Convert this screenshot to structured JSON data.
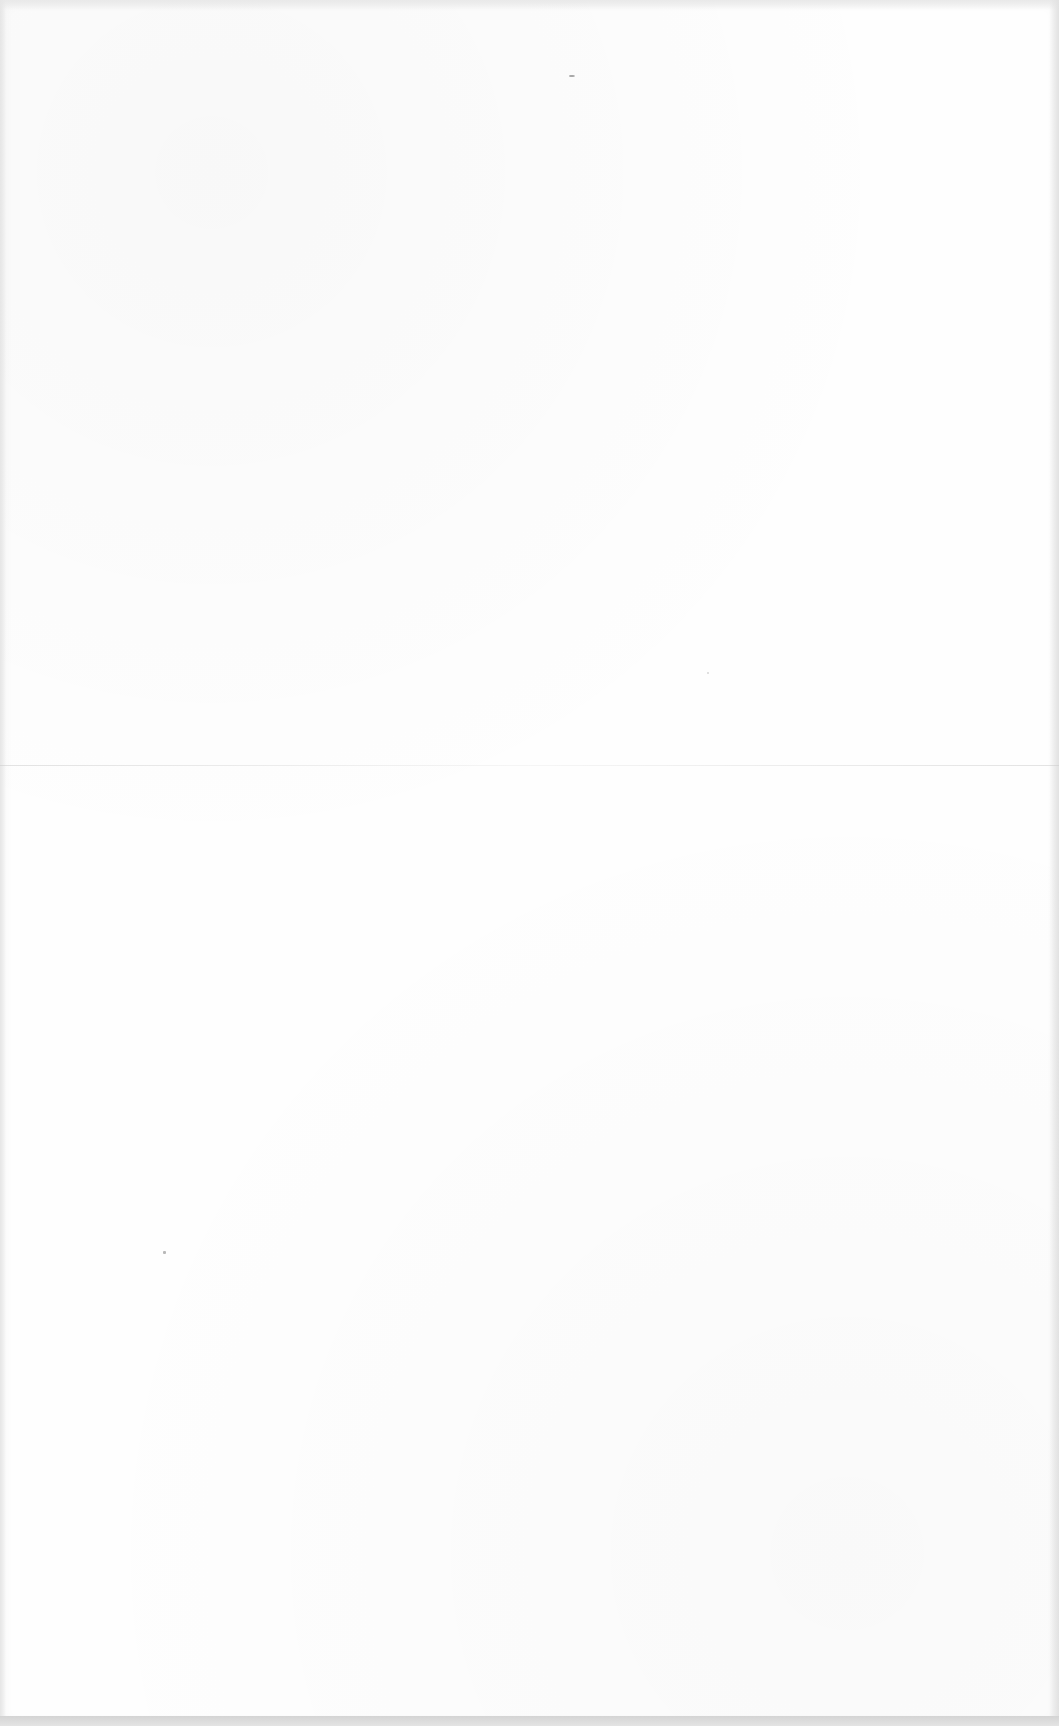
{
  "page": {
    "content": "",
    "background_color": "#fefefe"
  }
}
